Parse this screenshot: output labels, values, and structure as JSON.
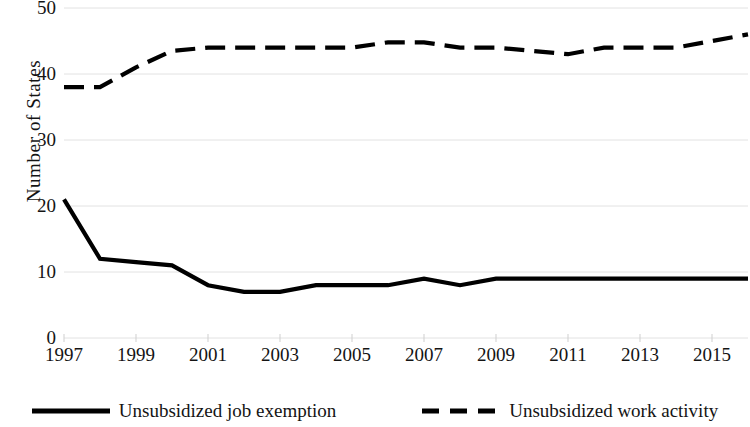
{
  "chart_data": {
    "type": "line",
    "title": "",
    "xlabel": "",
    "ylabel": "Number of States",
    "xlim": [
      1997,
      2016
    ],
    "ylim": [
      0,
      50
    ],
    "grid": true,
    "legend_position": "bottom",
    "x": [
      1997,
      1998,
      1999,
      2000,
      2001,
      2002,
      2003,
      2004,
      2005,
      2006,
      2007,
      2008,
      2009,
      2010,
      2011,
      2012,
      2013,
      2014,
      2015,
      2016
    ],
    "xticks": [
      "1997",
      "1999",
      "2001",
      "2003",
      "2005",
      "2007",
      "2009",
      "2011",
      "2013",
      "2015"
    ],
    "xtick_values": [
      1997,
      1999,
      2001,
      2003,
      2005,
      2007,
      2009,
      2011,
      2013,
      2015
    ],
    "yticks": [
      "0",
      "10",
      "20",
      "30",
      "40",
      "50"
    ],
    "ytick_values": [
      0,
      10,
      20,
      30,
      40,
      50
    ],
    "series": [
      {
        "name": "Unsubsidized job exemption",
        "style": "solid",
        "color": "#000000",
        "values": [
          21,
          12,
          11.5,
          11,
          8,
          7,
          7,
          8,
          8,
          8,
          9,
          8,
          9,
          9,
          9,
          9,
          9,
          9,
          9,
          9
        ]
      },
      {
        "name": "Unsubsidized work activity",
        "style": "dashed",
        "color": "#000000",
        "values": [
          38,
          38,
          41,
          43.5,
          44,
          44,
          44,
          44,
          44,
          44.8,
          44.8,
          44,
          44,
          43.5,
          43,
          44,
          44,
          44,
          45,
          46
        ]
      }
    ]
  },
  "legend": {
    "items": [
      {
        "label": "Unsubsidized job exemption",
        "style": "solid"
      },
      {
        "label": "Unsubsidized work activity",
        "style": "dashed"
      }
    ]
  },
  "colors": {
    "line": "#000000",
    "grid": "#e2e2e2",
    "text": "#141414",
    "background": "#ffffff"
  }
}
